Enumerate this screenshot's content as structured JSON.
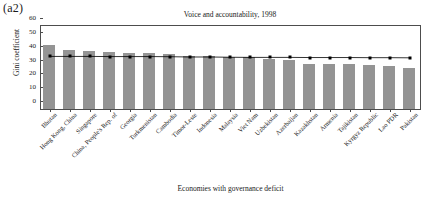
{
  "panel": {
    "label": "(a2)"
  },
  "chart_data": {
    "type": "bar",
    "title": "Voice and accountability, 1998",
    "xlabel": "Economies with governance deficit",
    "ylabel": "Gini coefficient",
    "ylim": [
      0,
      60
    ],
    "yticks": [
      0,
      10,
      20,
      30,
      40,
      50,
      60
    ],
    "grid": false,
    "legend": "none",
    "categories": [
      "Bhutan",
      "Hong Kong, China",
      "Singapore",
      "China, People's Rep. of",
      "Georgia",
      "Turkmenistan",
      "Cambodia",
      "Timor-Leste",
      "Indonesia",
      "Malaysia",
      "Viet Nam",
      "Uzbekistan",
      "Azerbaijan",
      "Kazakhstan",
      "Armenia",
      "Tajikistan",
      "Kyrgyz Republic",
      "Lao PDR",
      "Pakistan"
    ],
    "series": [
      {
        "name": "Gini coefficient",
        "type": "bar",
        "color": "#949494",
        "values": [
          46.5,
          43.0,
          42.0,
          41.3,
          40.5,
          40.3,
          40.0,
          38.5,
          38.3,
          37.5,
          37.3,
          36.3,
          35.5,
          32.8,
          32.8,
          32.3,
          31.8,
          31.2,
          29.8
        ]
      },
      {
        "name": "Average",
        "type": "line",
        "color": "#000000",
        "marker": "square",
        "values": [
          38.0,
          38.0,
          38.0,
          37.9,
          37.9,
          37.9,
          37.8,
          37.6,
          37.6,
          37.4,
          37.3,
          37.3,
          37.3,
          37.2,
          37.2,
          37.2,
          37.1,
          37.1,
          37.0
        ]
      }
    ]
  }
}
